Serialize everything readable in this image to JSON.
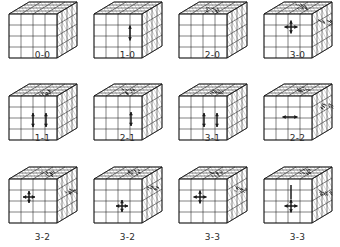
{
  "figure": {
    "type": "cube-grid-diagram",
    "columns": 4,
    "rows": 3,
    "line_color": "#1a1a1a",
    "hatch_color": "#8a8a8a",
    "label_color": "#2b2b2b",
    "background": "#ffffff",
    "cube_divisions": 4
  },
  "panels": [
    {
      "id": "panel-0-0",
      "label": "0-0",
      "row": 0,
      "col": 0,
      "annotations": [],
      "shading": []
    },
    {
      "id": "panel-1-0",
      "label": "1-0",
      "row": 0,
      "col": 1,
      "annotations": [
        {
          "kind": "arrow-vertical",
          "face": "front",
          "cx": 42,
          "cy": 33,
          "len": 15
        }
      ],
      "shading": []
    },
    {
      "id": "panel-2-0",
      "label": "2-0",
      "row": 0,
      "col": 2,
      "annotations": [],
      "shading": [
        {
          "face": "top",
          "cx": 38,
          "cy": 9
        }
      ]
    },
    {
      "id": "panel-3-0",
      "label": "3-0",
      "row": 0,
      "col": 3,
      "annotations": [
        {
          "kind": "arrow-cross",
          "face": "front",
          "cx": 33,
          "cy": 27,
          "len": 13
        }
      ],
      "shading": [
        {
          "face": "top",
          "cx": 42,
          "cy": 6
        },
        {
          "face": "right",
          "cx": 66,
          "cy": 22
        }
      ]
    },
    {
      "id": "panel-1-1",
      "label": "1-1",
      "row": 1,
      "col": 0,
      "annotations": [
        {
          "kind": "arrow-vertical",
          "face": "front",
          "cx": 30,
          "cy": 38,
          "len": 14
        },
        {
          "kind": "arrow-vertical",
          "face": "front",
          "cx": 43,
          "cy": 38,
          "len": 14
        }
      ],
      "shading": [
        {
          "face": "top",
          "cx": 40,
          "cy": 10
        }
      ]
    },
    {
      "id": "panel-2-1",
      "label": "2-1",
      "row": 1,
      "col": 1,
      "annotations": [
        {
          "kind": "arrow-vertical",
          "face": "front",
          "cx": 43,
          "cy": 37,
          "len": 14
        }
      ],
      "shading": [
        {
          "face": "top",
          "cx": 40,
          "cy": 9
        }
      ]
    },
    {
      "id": "panel-3-1",
      "label": "3-1",
      "row": 1,
      "col": 2,
      "annotations": [
        {
          "kind": "arrow-vertical",
          "face": "front",
          "cx": 31,
          "cy": 38,
          "len": 14
        },
        {
          "kind": "arrow-vertical",
          "face": "front",
          "cx": 44,
          "cy": 38,
          "len": 14
        }
      ],
      "shading": [
        {
          "face": "top",
          "cx": 43,
          "cy": 9
        }
      ]
    },
    {
      "id": "panel-2-2",
      "label": "2-2",
      "row": 1,
      "col": 3,
      "annotations": [
        {
          "kind": "arrow-horizontal",
          "face": "front",
          "cx": 32,
          "cy": 35,
          "len": 15
        }
      ],
      "shading": [
        {
          "face": "top",
          "cx": 44,
          "cy": 7
        },
        {
          "face": "right",
          "cx": 67,
          "cy": 24
        }
      ]
    },
    {
      "id": "panel-3-2-a",
      "label": "3-2",
      "row": 2,
      "col": 0,
      "annotations": [
        {
          "kind": "arrow-cross",
          "face": "front",
          "cx": 26,
          "cy": 32,
          "len": 12
        }
      ],
      "shading": [
        {
          "face": "top",
          "cx": 44,
          "cy": 8
        },
        {
          "face": "right",
          "cx": 67,
          "cy": 26
        }
      ]
    },
    {
      "id": "panel-3-2-b",
      "label": "3-2",
      "row": 2,
      "col": 1,
      "annotations": [
        {
          "kind": "arrow-cross",
          "face": "front",
          "cx": 34,
          "cy": 41,
          "len": 12
        }
      ],
      "shading": [
        {
          "face": "top",
          "cx": 44,
          "cy": 7
        },
        {
          "face": "right",
          "cx": 65,
          "cy": 23
        }
      ]
    },
    {
      "id": "panel-3-3-a",
      "label": "3-3",
      "row": 2,
      "col": 2,
      "annotations": [
        {
          "kind": "arrow-cross",
          "face": "front",
          "cx": 27,
          "cy": 32,
          "len": 13
        }
      ],
      "shading": [
        {
          "face": "top",
          "cx": 42,
          "cy": 8
        },
        {
          "face": "right",
          "cx": 67,
          "cy": 24
        }
      ]
    },
    {
      "id": "panel-3-3-b",
      "label": "3-3",
      "row": 2,
      "col": 3,
      "annotations": [
        {
          "kind": "arrow-cross",
          "face": "front",
          "cx": 33,
          "cy": 41,
          "len": 13
        },
        {
          "kind": "line-vertical",
          "face": "front",
          "cx": 33,
          "cy": 27,
          "len": 14
        }
      ],
      "shading": [
        {
          "face": "top",
          "cx": 46,
          "cy": 6
        },
        {
          "face": "right",
          "cx": 67,
          "cy": 27
        }
      ]
    }
  ]
}
